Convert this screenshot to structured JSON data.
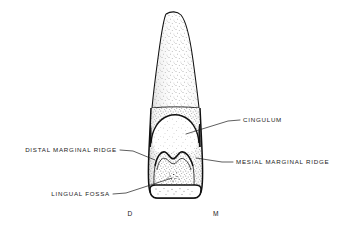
{
  "figure": {
    "kind": "anatomical-line-drawing",
    "background_color": "#ffffff",
    "ink_color": "#111111",
    "stipple_color": "#2a2a2a"
  },
  "labels": [
    {
      "id": "cingulum",
      "text": "CINGULUM",
      "side": "right",
      "text_x": 243,
      "text_y": 120,
      "leader": [
        [
          240,
          120
        ],
        [
          228,
          121
        ],
        [
          186,
          134
        ]
      ]
    },
    {
      "id": "distal-marginal-ridge",
      "text": "DISTAL MARGINAL RIDGE",
      "side": "left",
      "text_x": 117,
      "text_y": 150,
      "leader": [
        [
          120,
          150
        ],
        [
          133,
          151
        ],
        [
          155,
          160
        ]
      ]
    },
    {
      "id": "mesial-marginal-ridge",
      "text": "MESIAL MARGINAL RIDGE",
      "side": "right",
      "text_x": 236,
      "text_y": 162,
      "leader": [
        [
          233,
          162
        ],
        [
          222,
          162
        ],
        [
          196,
          158
        ]
      ]
    },
    {
      "id": "lingual-fossa",
      "text": "LINGUAL FOSSA",
      "side": "left",
      "text_x": 110,
      "text_y": 194,
      "leader": [
        [
          113,
          194
        ],
        [
          126,
          193
        ],
        [
          172,
          178
        ]
      ]
    }
  ],
  "orientation_markers": [
    {
      "id": "distal",
      "text": "D",
      "x": 130,
      "y": 214
    },
    {
      "id": "mesial",
      "text": "M",
      "x": 216,
      "y": 214
    }
  ]
}
